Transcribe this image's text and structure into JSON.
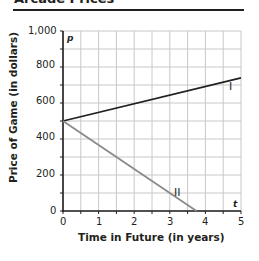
{
  "header": {
    "title": "Arcade Prices"
  },
  "chart_data": {
    "type": "line",
    "title": "Arcade Prices",
    "xlabel": "Time in Future (in years)",
    "ylabel": "Price of Game (in dollars)",
    "x_axis_var": "t",
    "y_axis_var": "p",
    "xlim": [
      0,
      5
    ],
    "ylim": [
      0,
      1000
    ],
    "x_ticks": [
      "0",
      "1",
      "2",
      "3",
      "4",
      "5"
    ],
    "y_ticks": [
      "0",
      "200",
      "400",
      "600",
      "800",
      "1,000"
    ],
    "grid": true,
    "grid_x_step": 0.5,
    "grid_y_step": 100,
    "series": [
      {
        "name": "I",
        "x": [
          0,
          5
        ],
        "y": [
          500,
          740
        ],
        "color": "#231f20"
      },
      {
        "name": "II",
        "x": [
          0,
          3.75
        ],
        "y": [
          500,
          0
        ],
        "color": "#8a8a8a"
      }
    ]
  }
}
